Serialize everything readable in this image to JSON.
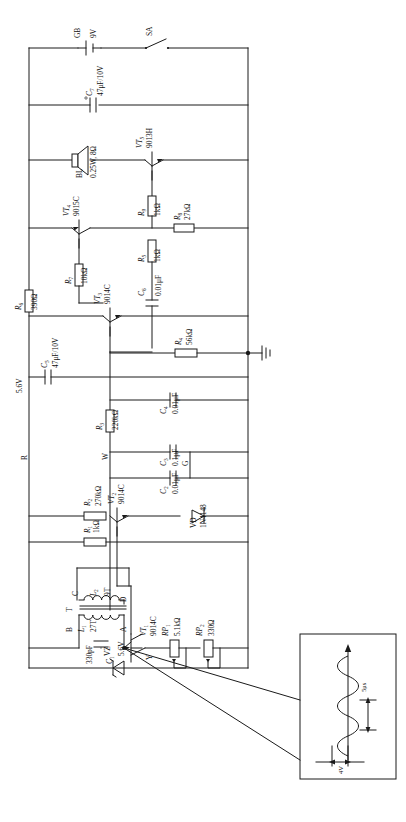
{
  "diagram": {
    "orientation": "rotated-90"
  },
  "power": {
    "battery_ref": "GB",
    "battery_value": "9V",
    "switch_ref": "SA"
  },
  "nodes": {
    "terminal_r": "R",
    "terminal_w": "W",
    "terminal_g": "G",
    "terminal_y": "Y",
    "rail_5v6": "5.6V",
    "zener_5v6": "5.6V"
  },
  "transformer": {
    "ref": "T",
    "winding1_ref": "L",
    "winding1_sub": "1",
    "winding1_turns": "27T",
    "winding2_ref": "L",
    "winding2_sub": "2",
    "winding2_turns": "9T",
    "tap_a": "A",
    "tap_b": "B",
    "tap_c": "C",
    "tap_d": "D"
  },
  "speaker": {
    "ref": "BL",
    "rating": "0.25W, 8Ω"
  },
  "transistors": [
    {
      "ref": "VT",
      "sub": "1",
      "type": "9014C"
    },
    {
      "ref": "VT",
      "sub": "2",
      "type": "9014C"
    },
    {
      "ref": "VT",
      "sub": "3",
      "type": "9014C"
    },
    {
      "ref": "VT",
      "sub": "4",
      "type": "9015C"
    },
    {
      "ref": "VT",
      "sub": "5",
      "type": "9013H"
    }
  ],
  "diodes": [
    {
      "ref": "VD",
      "type": "1N4148"
    },
    {
      "ref": "VZ",
      "type": "5.6V"
    }
  ],
  "resistors": [
    {
      "ref": "R",
      "sub": "1",
      "value": "1kΩ"
    },
    {
      "ref": "R",
      "sub": "2",
      "value": "270kΩ"
    },
    {
      "ref": "R",
      "sub": "3",
      "value": "220kΩ"
    },
    {
      "ref": "R",
      "sub": "4",
      "value": "56kΩ"
    },
    {
      "ref": "R",
      "sub": "5",
      "value": "1kΩ"
    },
    {
      "ref": "R",
      "sub": "6",
      "value": "390Ω"
    },
    {
      "ref": "R",
      "sub": "7",
      "value": "10kΩ"
    },
    {
      "ref": "R",
      "sub": "8",
      "value": "27kΩ"
    },
    {
      "ref": "R",
      "sub": "9",
      "value": "1kΩ"
    }
  ],
  "potentiometers": [
    {
      "ref": "RP",
      "sub": "1",
      "value": "5.1kΩ"
    },
    {
      "ref": "RP",
      "sub": "2",
      "value": "330Ω"
    }
  ],
  "capacitors": [
    {
      "ref": "C",
      "sub": "1",
      "value": "330pF"
    },
    {
      "ref": "C",
      "sub": "2",
      "value": "0.01μF"
    },
    {
      "ref": "C",
      "sub": "3",
      "value": "0.1μF"
    },
    {
      "ref": "C",
      "sub": "4",
      "value": "0.01μF"
    },
    {
      "ref": "C",
      "sub": "5",
      "value": "47μF/10V"
    },
    {
      "ref": "C",
      "sub": "6",
      "value": "0.01μF"
    },
    {
      "ref": "C",
      "sub": "7",
      "value": "47μF/10V"
    }
  ],
  "waveform_inset": {
    "time_label": "5μs",
    "amplitude_label": "4V",
    "shape": "sine"
  },
  "colors": {
    "line": "#1a1a1a",
    "background": "#ffffff",
    "text": "#111111"
  }
}
